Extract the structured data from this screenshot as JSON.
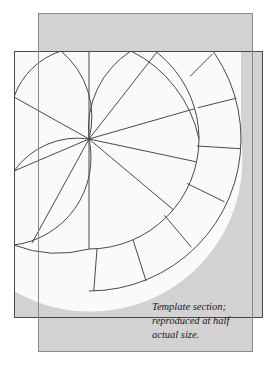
{
  "figure": {
    "kind": "template-diagram",
    "caption": {
      "line1": "Template section;",
      "line2": "reproduced at half",
      "line3": "actual size."
    },
    "colors": {
      "page_background": "#ffffff",
      "back_sheet_fill": "#d2d2d2",
      "back_sheet_stroke": "#8a8a8a",
      "front_sheet_fill": "#fafafa",
      "front_sheet_stroke": "#4a4a4a",
      "pattern_line": "#4a4a4a",
      "caption_color": "#1a1a1a"
    },
    "back_sheet": {
      "x": 38,
      "y": 13,
      "width": 215,
      "height": 339
    },
    "front_sheet": {
      "x": 14,
      "y": 51,
      "width": 249,
      "height": 267
    },
    "fan_center": {
      "x": 89,
      "y": 139
    },
    "radii": {
      "inner_band": 110,
      "outer_band": 152,
      "scallop": 78
    },
    "ray_angles_deg": [
      -90,
      -52,
      -16,
      12,
      40,
      68,
      90
    ],
    "band_divider_count": 7,
    "scallop_cusp_count": 5
  }
}
